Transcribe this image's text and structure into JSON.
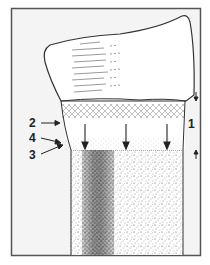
{
  "figure": {
    "frame_color": "#555555",
    "background": "#f4f4f4",
    "ink": "#222222",
    "labels": [
      {
        "id": "1",
        "text": "1",
        "x": 190,
        "y": 128
      },
      {
        "id": "2",
        "text": "2",
        "x": 29,
        "y": 127
      },
      {
        "id": "4",
        "text": "4",
        "x": 29,
        "y": 142
      },
      {
        "id": "3",
        "text": "3",
        "x": 29,
        "y": 159
      }
    ],
    "regions": [
      {
        "name": "crown",
        "description": "upper cap with striations"
      },
      {
        "name": "hatched-band",
        "description": "crosshatched transitional band"
      },
      {
        "name": "clear-zone",
        "description": "zone with downward arrows"
      },
      {
        "name": "stippled-column",
        "description": "lower stippled body with dark streak"
      }
    ]
  }
}
